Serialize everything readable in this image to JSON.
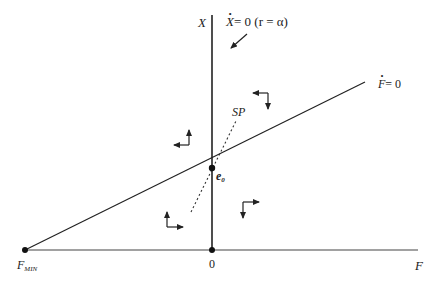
{
  "figure": {
    "axes": {
      "y_label": "X",
      "x_label": "F",
      "origin_label": "0",
      "x_min_label": "F",
      "x_min_subscript": "MIN"
    },
    "curves": {
      "x_dot_zero": {
        "label_var": "X",
        "label_eq": "= 0",
        "label_cond": "(r = α)"
      },
      "f_dot_zero": {
        "label_var": "F",
        "label_eq": "= 0"
      },
      "saddle_path": {
        "label": "SP",
        "style": "dotted"
      }
    },
    "equilibrium": {
      "label": "e",
      "subscript": "0"
    },
    "phase_arrows": [
      {
        "quadrant": "upper-left",
        "horizontal": "left",
        "vertical": "up"
      },
      {
        "quadrant": "upper-right",
        "horizontal": "left",
        "vertical": "down"
      },
      {
        "quadrant": "lower-left",
        "horizontal": "right",
        "vertical": "up"
      },
      {
        "quadrant": "lower-right",
        "horizontal": "right",
        "vertical": "down"
      }
    ],
    "colors": {
      "line": "#222222",
      "background": "#ffffff"
    }
  }
}
